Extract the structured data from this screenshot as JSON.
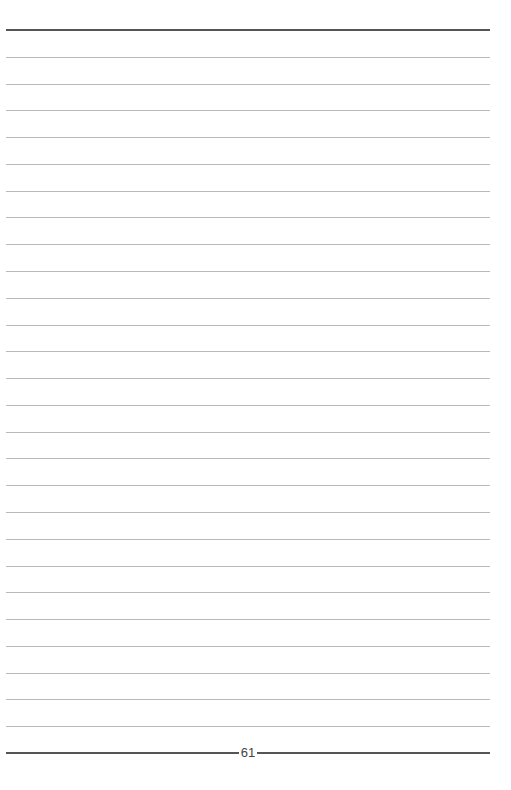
{
  "page": {
    "type": "lined-notebook-page",
    "page_number": "61",
    "ruled_line_count": 26,
    "top_border_y": 30,
    "bottom_border_y": 753,
    "colors": {
      "rule": "#b9b9b9",
      "border": "#555555",
      "background": "#ffffff"
    }
  }
}
